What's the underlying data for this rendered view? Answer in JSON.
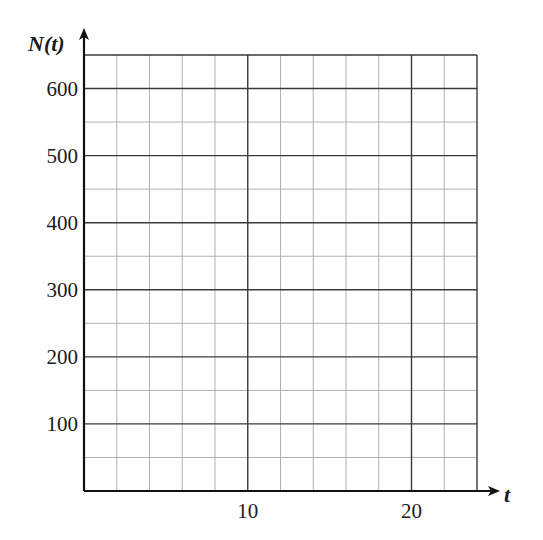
{
  "chart_data": {
    "type": "line",
    "title": "",
    "xlabel": "t",
    "ylabel": "N(t)",
    "xlim": [
      0,
      24
    ],
    "ylim": [
      0,
      650
    ],
    "x_ticks": [
      10,
      20
    ],
    "x_tick_labels": [
      "10",
      "20"
    ],
    "y_ticks": [
      100,
      200,
      300,
      400,
      500,
      600
    ],
    "y_tick_labels": [
      "100",
      "200",
      "300",
      "400",
      "500",
      "600"
    ],
    "grid": true,
    "minor_x_step": 2,
    "major_x_step": 10,
    "minor_y_step": 50,
    "major_y_step": 100,
    "series": [],
    "legend": null,
    "note": "Empty grid for plotting N(t) versus t; no data plotted."
  },
  "axes": {
    "y_title": "N(t)",
    "x_title": "t"
  },
  "colors": {
    "major_grid": "#3a3a3a",
    "minor_grid": "#a8a8a8",
    "axis": "#111111",
    "text": "#1a1a1a"
  }
}
